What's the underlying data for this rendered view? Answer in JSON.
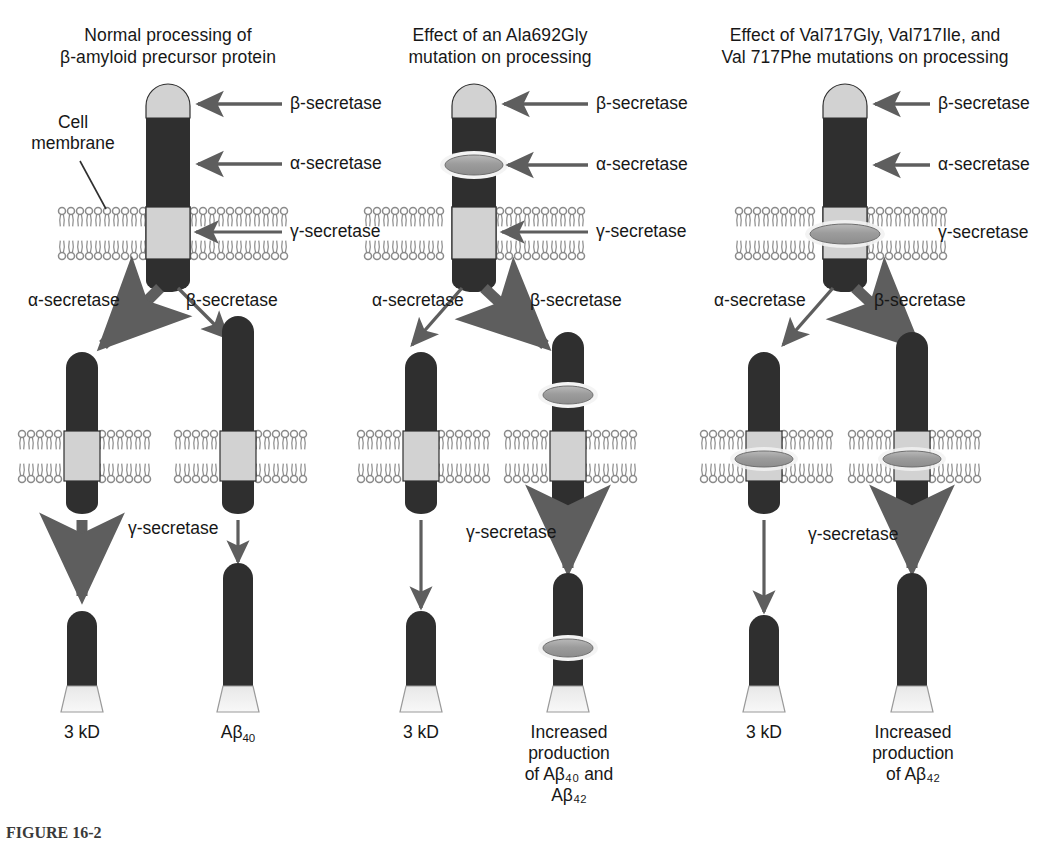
{
  "figure": {
    "caption_label": "FIGURE 16-2",
    "colors": {
      "protein_dark": "#2f2f2f",
      "protein_light": "#d2d2d2",
      "arrow_gray": "#5e5e5e",
      "membrane_gray": "#8a8a8a",
      "lens_gray": "#9a9a9a",
      "background": "#ffffff",
      "text": "#171717"
    }
  },
  "panels": [
    {
      "id": "normal",
      "title": "Normal processing of\nβ-amyloid precursor protein",
      "cell_membrane_label": "Cell\nmembrane",
      "secretase_labels": {
        "beta": "β-secretase",
        "alpha": "α-secretase",
        "gamma": "γ-secretase"
      },
      "branch_labels": {
        "left": "α-secretase",
        "right": "β-secretase"
      },
      "gamma_label": "γ-secretase",
      "branch_emphasis": {
        "left": "thick",
        "right": "thin"
      },
      "gamma_emphasis": {
        "left": "thick",
        "right": "thin"
      },
      "mutation_markers": [],
      "products": [
        {
          "label": "3 kD",
          "sub": "",
          "marker": false
        },
        {
          "label": "Aβ",
          "sub": "40",
          "marker": false
        }
      ]
    },
    {
      "id": "ala692gly",
      "title": "Effect of an Ala692Gly\nmutation on processing",
      "cell_membrane_label": "",
      "secretase_labels": {
        "beta": "β-secretase",
        "alpha": "α-secretase",
        "gamma": "γ-secretase"
      },
      "branch_labels": {
        "left": "α-secretase",
        "right": "β-secretase"
      },
      "gamma_label": "γ-secretase",
      "branch_emphasis": {
        "left": "thin",
        "right": "thick"
      },
      "gamma_emphasis": {
        "left": "thin",
        "right": "thick"
      },
      "mutation_markers": [
        "alpha-site"
      ],
      "products": [
        {
          "label": "3 kD",
          "sub": "",
          "marker": false
        },
        {
          "label": "Increased\nproduction\nof Aβ₄₀ and\nAβ₄₂",
          "sub": "",
          "marker": true
        }
      ]
    },
    {
      "id": "val717",
      "title": "Effect of Val717Gly, Val717Ile, and\nVal 717Phe mutations on processing",
      "cell_membrane_label": "",
      "secretase_labels": {
        "beta": "β-secretase",
        "alpha": "α-secretase",
        "gamma": "γ-secretase"
      },
      "branch_labels": {
        "left": "α-secretase",
        "right": "β-secretase"
      },
      "gamma_label": "γ-secretase",
      "branch_emphasis": {
        "left": "thin",
        "right": "thick"
      },
      "gamma_emphasis": {
        "left": "thin",
        "right": "thick"
      },
      "mutation_markers": [
        "gamma-site"
      ],
      "products": [
        {
          "label": "3 kD",
          "sub": "",
          "marker": false
        },
        {
          "label": "Increased\nproduction\nof Aβ₄₂",
          "sub": "",
          "marker": false
        }
      ]
    }
  ],
  "labels": {
    "p1_title": "Normal processing of\nβ-amyloid precursor protein",
    "p2_title": "Effect of an Ala692Gly\nmutation on processing",
    "p3_title": "Effect of Val717Gly, Val717Ile, and\nVal 717Phe mutations on processing",
    "cell_membrane": "Cell\nmembrane",
    "beta_secretase": "β-secretase",
    "alpha_secretase": "α-secretase",
    "gamma_secretase": "γ-secretase",
    "product_3kd": "3 kD",
    "product_abeta40_pre": "Aβ",
    "product_abeta40_sub": "40",
    "product_increased_40_42": "Increased\nproduction\nof Aβ₄₀ and\nAβ₄₂",
    "product_increased_42": "Increased\nproduction\nof Aβ₄₂",
    "caption": "FIGURE 16-2"
  }
}
